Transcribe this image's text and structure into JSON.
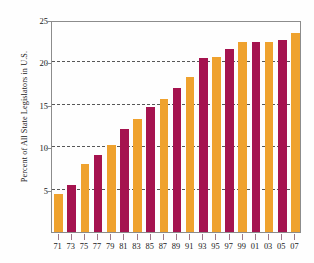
{
  "chart_data": {
    "type": "bar",
    "title": "",
    "xlabel": "",
    "ylabel": "Percent of All State Legislators in U.S.",
    "categories": [
      "71",
      "73",
      "75",
      "77",
      "79",
      "81",
      "83",
      "85",
      "87",
      "89",
      "91",
      "93",
      "95",
      "97",
      "99",
      "01",
      "03",
      "05",
      "07"
    ],
    "values": [
      4.5,
      5.6,
      8.0,
      9.1,
      10.3,
      12.1,
      13.3,
      14.8,
      15.7,
      17.0,
      18.3,
      20.5,
      20.6,
      21.6,
      22.4,
      22.4,
      22.4,
      22.7,
      23.5
    ],
    "ylim": [
      0,
      25
    ],
    "xlim_note": "categorical",
    "yticks": [
      5,
      10,
      15,
      20,
      25
    ],
    "ytick_labels": [
      "5",
      "10",
      "15",
      "20",
      "25"
    ],
    "grid": true,
    "legend": "none",
    "bar_colors": [
      "#efa22e",
      "#a5134f"
    ],
    "bar_color_pattern": "alternating",
    "axis_color": "#8c8c8c",
    "gridline_color": "#3a3a3a",
    "background": "#fefefe"
  }
}
